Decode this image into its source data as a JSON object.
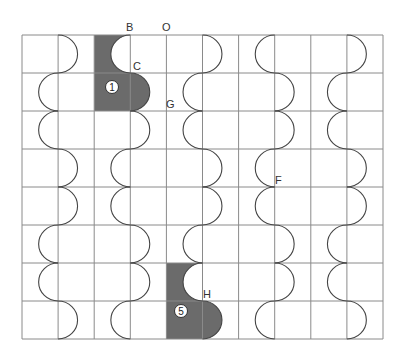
{
  "diagram": {
    "type": "grid-puzzle",
    "grid": {
      "x0": 22,
      "y0": 35,
      "cols": 10,
      "rows": 8,
      "cell_w": 36.1,
      "cell_h": 38,
      "line_color": "#8a8a8a"
    },
    "waves": [
      {
        "boundary": 1,
        "pattern": [
          "R",
          "L",
          "L",
          "R",
          "R",
          "L",
          "L",
          "R"
        ]
      },
      {
        "boundary": 3,
        "pattern": [
          "L",
          "R",
          "R",
          "L",
          "L",
          "R",
          "R",
          "L"
        ]
      },
      {
        "boundary": 5,
        "pattern": [
          "R",
          "L",
          "L",
          "R",
          "R",
          "L",
          "L",
          "R"
        ]
      },
      {
        "boundary": 7,
        "pattern": [
          "L",
          "R",
          "R",
          "L",
          "L",
          "R",
          "R",
          "L"
        ]
      },
      {
        "boundary": 9,
        "pattern": [
          "R",
          "L",
          "L",
          "R",
          "R",
          "L",
          "L",
          "R"
        ]
      }
    ],
    "shaded_pieces": [
      {
        "id": "piece-1",
        "label": "1",
        "col": 2,
        "row_top": 0,
        "color": "#6b6b6b",
        "badge": {
          "x": 112,
          "y": 87
        }
      },
      {
        "id": "piece-5",
        "label": "5",
        "col": 4,
        "row_top": 6,
        "color": "#6b6b6b",
        "badge": {
          "x": 181,
          "y": 311
        }
      }
    ],
    "point_labels": [
      {
        "text": "B",
        "x": 126,
        "y": 31
      },
      {
        "text": "O",
        "x": 162,
        "y": 31
      },
      {
        "text": "C",
        "x": 133,
        "y": 70
      },
      {
        "text": "G",
        "x": 166,
        "y": 108
      },
      {
        "text": "F",
        "x": 275,
        "y": 184
      },
      {
        "text": "H",
        "x": 203,
        "y": 298
      }
    ]
  }
}
